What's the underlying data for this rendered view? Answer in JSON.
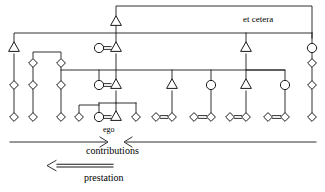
{
  "figure": {
    "type": "kinship-diagram",
    "title": "",
    "background_color": "#ffffff",
    "line_color": "#1a1a1a"
  },
  "labels": {
    "et_cetera": "et cetera",
    "ego": "ego",
    "contributions": "contributions",
    "prestation": "prestation"
  },
  "legend": {
    "contributions_arrows": "two arrows pointing inward toward ego (> <)",
    "prestation_arrow": "double-line arrow pointing left (<=====)"
  },
  "symbols": {
    "triangle": "male",
    "circle": "female",
    "diamond": "sibling-or-person-unspecified-sex",
    "double_line": "marriage-union"
  },
  "generations": [
    {
      "name": "generation-0",
      "y": 22
    },
    {
      "name": "generation-1",
      "y": 48
    },
    {
      "name": "generation-2",
      "y": 85
    },
    {
      "name": "generation-3",
      "y": 117
    }
  ],
  "nodes": [
    {
      "id": "g0-m1",
      "shape": "triangle",
      "x": 116,
      "y": 22
    },
    {
      "id": "g1-t1",
      "shape": "triangle",
      "x": 14,
      "y": 48
    },
    {
      "id": "g1-c1",
      "shape": "circle",
      "x": 99,
      "y": 48
    },
    {
      "id": "g1-t2",
      "shape": "triangle",
      "x": 116,
      "y": 48
    },
    {
      "id": "g1-t3",
      "shape": "triangle",
      "x": 246,
      "y": 48
    },
    {
      "id": "g1-c2",
      "shape": "circle",
      "x": 312,
      "y": 48
    },
    {
      "id": "g1b-d1",
      "shape": "diamond",
      "x": 33,
      "y": 63
    },
    {
      "id": "g1b-d2",
      "shape": "diamond",
      "x": 61,
      "y": 63
    },
    {
      "id": "g1b-d3",
      "shape": "diamond",
      "x": 312,
      "y": 63
    },
    {
      "id": "g2-d1",
      "shape": "diamond",
      "x": 14,
      "y": 85
    },
    {
      "id": "g2-d2",
      "shape": "diamond",
      "x": 33,
      "y": 85
    },
    {
      "id": "g2-d3",
      "shape": "diamond",
      "x": 61,
      "y": 85
    },
    {
      "id": "g2-c1",
      "shape": "circle",
      "x": 99,
      "y": 85
    },
    {
      "id": "g2-t1",
      "shape": "triangle",
      "x": 116,
      "y": 85
    },
    {
      "id": "g2-t2",
      "shape": "triangle",
      "x": 172,
      "y": 85
    },
    {
      "id": "g2-c2",
      "shape": "circle",
      "x": 211,
      "y": 85
    },
    {
      "id": "g2-t3",
      "shape": "triangle",
      "x": 246,
      "y": 85
    },
    {
      "id": "g2-c3",
      "shape": "circle",
      "x": 285,
      "y": 85
    },
    {
      "id": "g2-d4",
      "shape": "diamond",
      "x": 312,
      "y": 85
    },
    {
      "id": "g3-d1",
      "shape": "diamond",
      "x": 14,
      "y": 117
    },
    {
      "id": "g3-d2",
      "shape": "diamond",
      "x": 33,
      "y": 117
    },
    {
      "id": "g3-d3",
      "shape": "diamond",
      "x": 61,
      "y": 117
    },
    {
      "id": "g3-d4",
      "shape": "diamond",
      "x": 79,
      "y": 117
    },
    {
      "id": "g3-c1",
      "shape": "circle",
      "x": 99,
      "y": 117
    },
    {
      "id": "g3-ego",
      "shape": "triangle",
      "x": 116,
      "y": 117
    },
    {
      "id": "g3-d5",
      "shape": "diamond",
      "x": 136,
      "y": 117
    },
    {
      "id": "g3-d6",
      "shape": "diamond",
      "x": 156,
      "y": 117
    },
    {
      "id": "g3-d7",
      "shape": "diamond",
      "x": 172,
      "y": 117
    },
    {
      "id": "g3-d8",
      "shape": "diamond",
      "x": 194,
      "y": 117
    },
    {
      "id": "g3-d9",
      "shape": "diamond",
      "x": 211,
      "y": 117
    },
    {
      "id": "g3-d10",
      "shape": "diamond",
      "x": 230,
      "y": 117
    },
    {
      "id": "g3-d11",
      "shape": "diamond",
      "x": 246,
      "y": 117
    },
    {
      "id": "g3-d12",
      "shape": "diamond",
      "x": 268,
      "y": 117
    },
    {
      "id": "g3-d13",
      "shape": "diamond",
      "x": 285,
      "y": 117
    },
    {
      "id": "g3-d14",
      "shape": "diamond",
      "x": 312,
      "y": 117
    }
  ]
}
